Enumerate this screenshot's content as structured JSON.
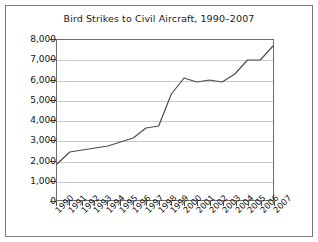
{
  "figure": {
    "title": "Bird Strikes to Civil Aircraft, 1990–2007",
    "border_color": "#7a7a7a",
    "background_color": "#ffffff",
    "line_color": "#4d4d4d",
    "gridline_color": "#c9c9c9",
    "axis_color": "#6d6d6d"
  },
  "chart_data": {
    "type": "line",
    "title": "Bird Strikes to Civil Aircraft, 1990–2007",
    "xlabel": "",
    "ylabel": "",
    "ylim": [
      0,
      8000
    ],
    "ytick_step": 1000,
    "grid": true,
    "legend": "none",
    "markers": false,
    "categories": [
      "1990",
      "1991",
      "1992",
      "1993",
      "1994",
      "1995",
      "1996",
      "1997",
      "1998",
      "1999",
      "2000",
      "2001",
      "2002",
      "2003",
      "2004",
      "2005",
      "2006",
      "2007"
    ],
    "x": [
      1990,
      1991,
      1992,
      1993,
      1994,
      1995,
      1996,
      1997,
      1998,
      1999,
      2000,
      2001,
      2002,
      2003,
      2004,
      2005,
      2006,
      2007
    ],
    "values": [
      1800,
      2400,
      2500,
      2600,
      2700,
      2900,
      3100,
      3600,
      3700,
      5300,
      6100,
      5900,
      6000,
      5900,
      6300,
      7000,
      7000,
      7700
    ],
    "ytick_labels": [
      "0",
      "1,000",
      "2,000",
      "3,000",
      "4,000",
      "5,000",
      "6,000",
      "7,000",
      "8,000"
    ],
    "ytick_values": [
      0,
      1000,
      2000,
      3000,
      4000,
      5000,
      6000,
      7000,
      8000
    ]
  }
}
